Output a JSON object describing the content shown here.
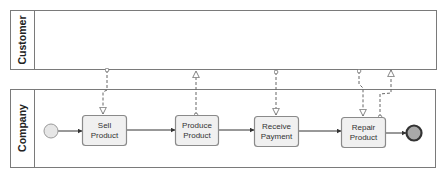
{
  "diagram": {
    "type": "BPMN collaboration",
    "colors": {
      "pool_stroke": "#7a7a7a",
      "task_fill": "#f0f0f0",
      "task_stroke": "#8a8a8a",
      "start_fill": "#e6e6e6",
      "end_fill": "#a9a9a9",
      "end_stroke": "#333333",
      "flow": "#333333",
      "message_flow": "#666666"
    },
    "pools": [
      {
        "id": "customer",
        "label": "Customer"
      },
      {
        "id": "company",
        "label": "Company"
      }
    ],
    "events": {
      "start": {
        "id": "start",
        "type": "start-event"
      },
      "end": {
        "id": "end",
        "type": "end-event"
      }
    },
    "tasks": [
      {
        "id": "sell",
        "line1": "Sell",
        "line2": "Product"
      },
      {
        "id": "produce",
        "line1": "Produce",
        "line2": "Product"
      },
      {
        "id": "receive",
        "line1": "Receive",
        "line2": "Payment"
      },
      {
        "id": "repair",
        "line1": "Repair",
        "line2": "Product"
      }
    ],
    "sequence_flows": [
      {
        "from": "start",
        "to": "sell"
      },
      {
        "from": "sell",
        "to": "produce"
      },
      {
        "from": "produce",
        "to": "receive"
      },
      {
        "from": "receive",
        "to": "repair"
      },
      {
        "from": "repair",
        "to": "end"
      }
    ],
    "message_flows": [
      {
        "from": "customer",
        "to": "sell"
      },
      {
        "from": "produce",
        "to": "customer"
      },
      {
        "from": "customer",
        "to": "receive"
      },
      {
        "from": "customer",
        "to": "repair"
      },
      {
        "from": "repair",
        "to": "customer"
      }
    ]
  }
}
